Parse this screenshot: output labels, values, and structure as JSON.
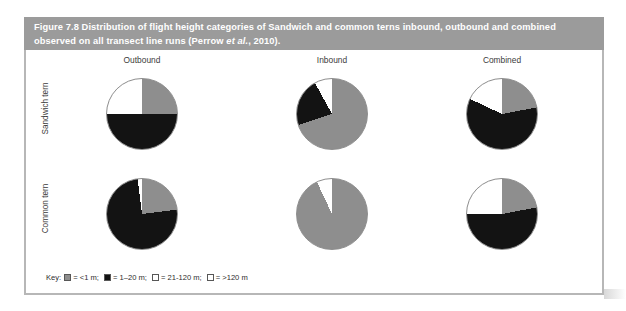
{
  "figure": {
    "caption_prefix": "Figure 7.8 Distribution of flight height categories of Sandwich and common terns inbound, outbound and combined observed on all transect line runs (Perrow ",
    "caption_italic": "et al.",
    "caption_suffix": ", 2010).",
    "caption_full": "Figure 7.8 Distribution of flight height categories of Sandwich and common terns inbound, outbound and combined observed on all transect line runs (Perrow et al., 2010)."
  },
  "columns": [
    {
      "label": "Outbound"
    },
    {
      "label": "Inbound"
    },
    {
      "label": "Combined"
    }
  ],
  "rows": [
    {
      "label": "Sandwich tern"
    },
    {
      "label": "Common tern"
    }
  ],
  "legend": {
    "title": "Key:",
    "items": [
      {
        "swatch": "gray",
        "text": "= <1 m;"
      },
      {
        "swatch": "black",
        "text": "= 1–20 m;"
      },
      {
        "swatch": "white",
        "text": "= 21-120 m;"
      },
      {
        "swatch": "white",
        "text": "= >120 m"
      }
    ]
  },
  "colors": {
    "band": "#9b9b9b",
    "panel_border": "#b7b7b7",
    "gray": "#8e8e8e",
    "black": "#131313",
    "white": "#ffffff",
    "pie_outline": "#8d8d8d"
  },
  "chart_data": {
    "type": "pie",
    "title": "Distribution of flight height categories of Sandwich and common terns inbound, outbound and combined observed on all transect line runs",
    "categories": [
      "<1 m",
      "1–20 m",
      "21-120 m",
      ">120 m"
    ],
    "category_colors": [
      "#8e8e8e",
      "#131313",
      "#ffffff",
      "#ffffff"
    ],
    "legend_position": "bottom-left",
    "grid": false,
    "panels": [
      {
        "row": "Sandwich tern",
        "column": "Outbound",
        "values": [
          25,
          50,
          25,
          0
        ],
        "slices": [
          {
            "category": "<1 m",
            "value": 25,
            "color": "#8e8e8e"
          },
          {
            "category": "1–20 m",
            "value": 50,
            "color": "#131313"
          },
          {
            "category": "21-120 m",
            "value": 25,
            "color": "#ffffff"
          },
          {
            "category": ">120 m",
            "value": 0,
            "color": "#ffffff"
          }
        ]
      },
      {
        "row": "Sandwich tern",
        "column": "Inbound",
        "values": [
          70,
          22,
          8,
          0
        ],
        "slices": [
          {
            "category": "<1 m",
            "value": 70,
            "color": "#8e8e8e"
          },
          {
            "category": "1–20 m",
            "value": 22,
            "color": "#131313"
          },
          {
            "category": "21-120 m",
            "value": 8,
            "color": "#ffffff"
          },
          {
            "category": ">120 m",
            "value": 0,
            "color": "#ffffff"
          }
        ]
      },
      {
        "row": "Sandwich tern",
        "column": "Combined",
        "values": [
          22,
          60,
          18,
          0
        ],
        "slices": [
          {
            "category": "<1 m",
            "value": 22,
            "color": "#8e8e8e"
          },
          {
            "category": "1–20 m",
            "value": 60,
            "color": "#131313"
          },
          {
            "category": "21-120 m",
            "value": 18,
            "color": "#ffffff"
          },
          {
            "category": ">120 m",
            "value": 0,
            "color": "#ffffff"
          }
        ]
      },
      {
        "row": "Common tern",
        "column": "Outbound",
        "values": [
          23,
          75,
          2,
          0
        ],
        "slices": [
          {
            "category": "<1 m",
            "value": 23,
            "color": "#8e8e8e"
          },
          {
            "category": "1–20 m",
            "value": 75,
            "color": "#131313"
          },
          {
            "category": "21-120 m",
            "value": 2,
            "color": "#ffffff"
          },
          {
            "category": ">120 m",
            "value": 0,
            "color": "#ffffff"
          }
        ]
      },
      {
        "row": "Common tern",
        "column": "Inbound",
        "values": [
          93,
          0,
          7,
          0
        ],
        "slices": [
          {
            "category": "<1 m",
            "value": 93,
            "color": "#8e8e8e"
          },
          {
            "category": "1–20 m",
            "value": 0,
            "color": "#131313"
          },
          {
            "category": "21-120 m",
            "value": 7,
            "color": "#ffffff"
          },
          {
            "category": ">120 m",
            "value": 0,
            "color": "#ffffff"
          }
        ]
      },
      {
        "row": "Common tern",
        "column": "Combined",
        "values": [
          22,
          53,
          25,
          0
        ],
        "slices": [
          {
            "category": "<1 m",
            "value": 22,
            "color": "#8e8e8e"
          },
          {
            "category": "1–20 m",
            "value": 53,
            "color": "#131313"
          },
          {
            "category": "21-120 m",
            "value": 25,
            "color": "#ffffff"
          },
          {
            "category": ">120 m",
            "value": 0,
            "color": "#ffffff"
          }
        ]
      }
    ]
  }
}
